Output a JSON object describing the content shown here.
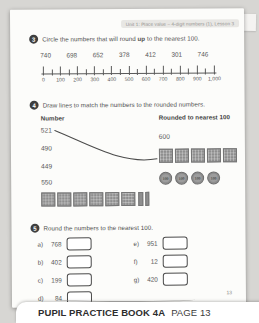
{
  "page": {
    "header_tag": "Unit 1: Place value – 4-digit numbers (1), Lesson 3",
    "page_number": "13"
  },
  "q3": {
    "number": "3",
    "prompt_before": "Circle the numbers that will round ",
    "prompt_bold": "up",
    "prompt_after": " to the nearest 100.",
    "numbers": [
      "740",
      "698",
      "652",
      "378",
      "412",
      "301",
      "746"
    ],
    "number_line": {
      "labels": [
        "0",
        "100",
        "200",
        "300",
        "400",
        "500",
        "600",
        "700",
        "800",
        "900",
        "1,000"
      ]
    }
  },
  "q4": {
    "number": "4",
    "prompt": "Draw lines to match the numbers to the rounded numbers.",
    "left_header": "Number",
    "right_header": "Rounded to nearest 100",
    "left_numbers": [
      "521",
      "490",
      "449",
      "550"
    ],
    "left_blocks": {
      "hundreds": 6,
      "tens": 2
    },
    "right_number": "600",
    "right_blocks": {
      "hundreds": 5,
      "tens": 0
    },
    "right_counters": {
      "count": 4,
      "label": "100"
    }
  },
  "q5": {
    "number": "5",
    "prompt": "Round the numbers to the nearest 100.",
    "items_left": [
      {
        "label": "a)",
        "value": "768"
      },
      {
        "label": "b)",
        "value": "402"
      },
      {
        "label": "c)",
        "value": "199"
      },
      {
        "label": "d)",
        "value": "84"
      }
    ],
    "items_right": [
      {
        "label": "e)",
        "value": "951"
      },
      {
        "label": "f)",
        "value": "12"
      },
      {
        "label": "g)",
        "value": "420"
      }
    ]
  },
  "footer": {
    "book": "PUPIL PRACTICE BOOK 4A",
    "page": "PAGE 13"
  },
  "colors": {
    "badge": "#3e3e3e",
    "block": "#8e8e8e",
    "text": "#4f4f4f"
  }
}
